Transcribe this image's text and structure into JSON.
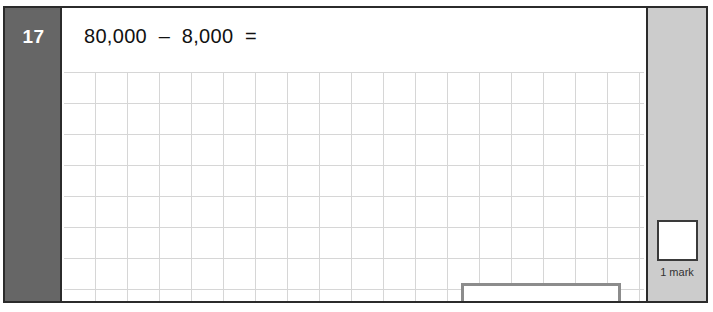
{
  "question": {
    "number": "17",
    "text": "80,000  –  8,000  =",
    "answer_value": "",
    "answer_placeholder": ""
  },
  "marks": {
    "score_value": "",
    "label": "1 mark"
  },
  "colors": {
    "number_column_bg": "#666666",
    "mark_column_bg": "#cccccc",
    "frame_border": "#2b2b2b",
    "grid_line": "#d6d6d6",
    "answer_box_border": "#8c8c8c"
  }
}
